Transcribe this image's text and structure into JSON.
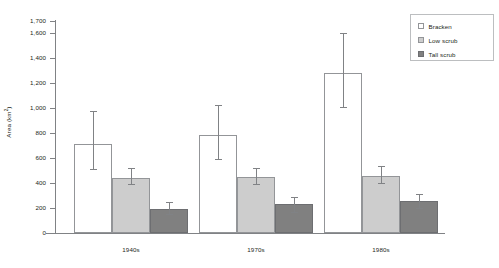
{
  "chart_data": {
    "type": "bar",
    "title": "",
    "xlabel": "",
    "ylabel": "Area (km²)",
    "ylabel_text": "Area (km",
    "ylabel_sup": "2",
    "ylabel_close": ")",
    "categories": [
      "1940s",
      "1970s",
      "1980s"
    ],
    "ylim": [
      0,
      1700
    ],
    "yticks": [
      0,
      200,
      400,
      600,
      800,
      1000,
      1200,
      1400,
      1600,
      1700
    ],
    "ytick_labels": [
      "0",
      "200",
      "400",
      "600",
      "800",
      "1,000",
      "1,200",
      "1,400",
      "1,600",
      "1,700"
    ],
    "grid": false,
    "legend_position": "top-right",
    "error_bars": true,
    "series": [
      {
        "name": "Bracken",
        "color": "#ffffff",
        "values": [
          710,
          785,
          1285
        ],
        "err_low": [
          510,
          590,
          1010
        ],
        "err_high": [
          975,
          1030,
          1600
        ]
      },
      {
        "name": "Low scrub",
        "color": "#cdcdcd",
        "values": [
          445,
          450,
          460
        ],
        "err_low": [
          390,
          395,
          400
        ],
        "err_high": [
          520,
          525,
          535
        ]
      },
      {
        "name": "Tall scrub",
        "color": "#808080",
        "values": [
          195,
          230,
          255
        ],
        "err_low": [
          150,
          170,
          200
        ],
        "err_high": [
          250,
          290,
          310
        ]
      }
    ]
  },
  "legend": {
    "items": [
      {
        "label": "Bracken",
        "swatch": "bracken"
      },
      {
        "label": "Low scrub",
        "swatch": "low"
      },
      {
        "label": "Tall scrub",
        "swatch": "tall"
      }
    ]
  }
}
